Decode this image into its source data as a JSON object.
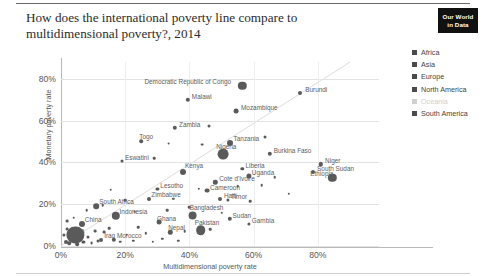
{
  "header": {
    "title": "How does the international poverty line compare to multidimensional poverty?, 2014",
    "badge_line1": "Our World",
    "badge_line2": "in Data"
  },
  "legend": {
    "position": "right",
    "items": [
      {
        "label": "Africa",
        "color": "#4a4a4a",
        "muted": false
      },
      {
        "label": "Asia",
        "color": "#4a4a4a",
        "muted": false
      },
      {
        "label": "Europe",
        "color": "#4a4a4a",
        "muted": false
      },
      {
        "label": "North America",
        "color": "#4a4a4a",
        "muted": false
      },
      {
        "label": "Oceania",
        "color": "#cfcfcf",
        "muted": true
      },
      {
        "label": "South America",
        "color": "#4a4a4a",
        "muted": false
      }
    ]
  },
  "chart_data": {
    "type": "scatter",
    "title": "How does the international poverty line compare to multidimensional poverty?, 2014",
    "xlabel": "Multidimensional poverty rate",
    "ylabel": "Monetary poverty rate",
    "xlim": [
      0,
      90
    ],
    "ylim": [
      0,
      88
    ],
    "xticks": [
      0,
      20,
      40,
      60,
      80
    ],
    "xticklabels": [
      "0%",
      "20%",
      "40%",
      "60%",
      "80%"
    ],
    "yticks": [
      0,
      20,
      40,
      60,
      80
    ],
    "yticklabels": [
      "0%",
      "20%",
      "40%",
      "60%",
      "80%"
    ],
    "grid": true,
    "reference_line": {
      "type": "diagonal-45",
      "label": "y = x"
    },
    "size_encoding": "population",
    "color_encoding": "continent",
    "points": [
      {
        "label": "Democratic Republic of Congo",
        "x": 56.5,
        "y": 76.5,
        "r": 4.2,
        "lx": -98,
        "ly": -3
      },
      {
        "label": "Burundi",
        "x": 74.5,
        "y": 73.0,
        "r": 2.0,
        "lx": 5,
        "ly": -2
      },
      {
        "label": "Malawi",
        "x": 39.5,
        "y": 70.0,
        "r": 2.2,
        "lx": 4,
        "ly": -2
      },
      {
        "label": "Mozambique",
        "x": 54.5,
        "y": 64.5,
        "r": 2.4,
        "lx": 5,
        "ly": -2
      },
      {
        "label": "Zambia",
        "x": 35.5,
        "y": 56.5,
        "r": 2.2,
        "lx": 4,
        "ly": -2
      },
      {
        "label": "Tanzania",
        "x": 52.5,
        "y": 49.5,
        "r": 3.0,
        "lx": 4,
        "ly": -3
      },
      {
        "label": "Togo",
        "x": 25.0,
        "y": 50.0,
        "r": 1.8,
        "lx": -2,
        "ly": -3
      },
      {
        "label": "Nigeria",
        "x": 50.5,
        "y": 44.0,
        "r": 5.4,
        "lx": -7,
        "ly": -6
      },
      {
        "label": "Burkina Faso",
        "x": 65.0,
        "y": 44.0,
        "r": 2.2,
        "lx": 4,
        "ly": -2
      },
      {
        "label": "Niger",
        "x": 81.0,
        "y": 39.0,
        "r": 2.2,
        "lx": 4,
        "ly": -2
      },
      {
        "label": "South Sudan",
        "x": 78.5,
        "y": 35.5,
        "r": 2.0,
        "lx": 4,
        "ly": -2
      },
      {
        "label": "Liberia",
        "x": 56.5,
        "y": 37.0,
        "r": 1.7,
        "lx": 3,
        "ly": -2
      },
      {
        "label": "Uganda",
        "x": 58.5,
        "y": 33.5,
        "r": 2.6,
        "lx": 3,
        "ly": -2
      },
      {
        "label": "Ethiopia",
        "x": 84.5,
        "y": 32.5,
        "r": 4.2,
        "lx": -22,
        "ly": -3
      },
      {
        "label": "Cote d'Ivoire",
        "x": 48.0,
        "y": 30.5,
        "r": 2.2,
        "lx": 4,
        "ly": -2
      },
      {
        "label": "Eswatini",
        "x": 19.0,
        "y": 40.5,
        "r": 1.5,
        "lx": 3,
        "ly": -2
      },
      {
        "label": "Kenya",
        "x": 38.0,
        "y": 35.5,
        "r": 3.0,
        "lx": 2,
        "ly": -5
      },
      {
        "label": "Lesotho",
        "x": 30.0,
        "y": 27.5,
        "r": 1.6,
        "lx": 3,
        "ly": -2
      },
      {
        "label": "Cameroon",
        "x": 45.5,
        "y": 26.5,
        "r": 2.4,
        "lx": 3,
        "ly": -2
      },
      {
        "label": "Zimbabwe",
        "x": 27.5,
        "y": 22.5,
        "r": 2.0,
        "lx": 2,
        "ly": -3
      },
      {
        "label": "Timor",
        "x": 52.0,
        "y": 22.0,
        "r": 1.6,
        "lx": 3,
        "ly": -2
      },
      {
        "label": "Haiti",
        "x": 49.5,
        "y": 22.5,
        "r": 2.0,
        "lx": 4,
        "ly": -2
      },
      {
        "label": "South Africa",
        "x": 11.0,
        "y": 19.0,
        "r": 2.8,
        "lx": 3,
        "ly": -3
      },
      {
        "label": "Indonesia",
        "x": 17.0,
        "y": 14.5,
        "r": 4.2,
        "lx": 4,
        "ly": -3
      },
      {
        "label": "Bangladesh",
        "x": 41.0,
        "y": 14.5,
        "r": 4.4,
        "lx": -3,
        "ly": -7
      },
      {
        "label": "Sudan",
        "x": 52.5,
        "y": 13.0,
        "r": 2.2,
        "lx": 3,
        "ly": -2
      },
      {
        "label": "Gambia",
        "x": 58.5,
        "y": 10.5,
        "r": 1.6,
        "lx": 3,
        "ly": -2
      },
      {
        "label": "Ghana",
        "x": 30.5,
        "y": 11.5,
        "r": 2.4,
        "lx": -2,
        "ly": -2
      },
      {
        "label": "Pakistan",
        "x": 43.5,
        "y": 7.5,
        "r": 4.8,
        "lx": -6,
        "ly": -6
      },
      {
        "label": "Nepal",
        "x": 34.0,
        "y": 6.5,
        "r": 2.2,
        "lx": -2,
        "ly": -3
      },
      {
        "label": "China",
        "x": 6.5,
        "y": 10.5,
        "r": 3.0,
        "lx": 3,
        "ly": -3
      },
      {
        "label": "India",
        "x": 4.5,
        "y": 5.5,
        "r": 8.6,
        "lx": -5,
        "ly": 0
      },
      {
        "label": "Iraq",
        "x": 12.5,
        "y": 3.0,
        "r": 2.0,
        "lx": 3,
        "ly": 0
      },
      {
        "label": "Morocco",
        "x": 16.5,
        "y": 3.0,
        "r": 2.2,
        "lx": 3,
        "ly": 0
      }
    ],
    "unlabeled_points": [
      {
        "x": 1.5,
        "y": 2.0,
        "r": 2.0
      },
      {
        "x": 2.5,
        "y": 1.2,
        "r": 1.8
      },
      {
        "x": 3.0,
        "y": 3.5,
        "r": 1.5
      },
      {
        "x": 1.0,
        "y": 5.5,
        "r": 1.6
      },
      {
        "x": 2.0,
        "y": 8.0,
        "r": 1.4
      },
      {
        "x": 5.0,
        "y": 1.0,
        "r": 1.8
      },
      {
        "x": 7.0,
        "y": 2.0,
        "r": 1.6
      },
      {
        "x": 8.5,
        "y": 4.5,
        "r": 1.5
      },
      {
        "x": 9.5,
        "y": 1.5,
        "r": 1.4
      },
      {
        "x": 6.0,
        "y": 6.0,
        "r": 1.5
      },
      {
        "x": 4.0,
        "y": 13.5,
        "r": 1.3
      },
      {
        "x": 1.8,
        "y": 12.0,
        "r": 1.4
      },
      {
        "x": 10.5,
        "y": 7.0,
        "r": 1.4
      },
      {
        "x": 11.5,
        "y": 2.5,
        "r": 1.5
      },
      {
        "x": 13.5,
        "y": 6.5,
        "r": 1.4
      },
      {
        "x": 15.0,
        "y": 8.5,
        "r": 1.3
      },
      {
        "x": 18.5,
        "y": 2.0,
        "r": 1.3
      },
      {
        "x": 20.5,
        "y": 5.5,
        "r": 1.3
      },
      {
        "x": 22.5,
        "y": 2.5,
        "r": 1.2
      },
      {
        "x": 24.0,
        "y": 9.0,
        "r": 1.3
      },
      {
        "x": 26.5,
        "y": 6.0,
        "r": 1.2
      },
      {
        "x": 28.5,
        "y": 2.0,
        "r": 1.2
      },
      {
        "x": 31.5,
        "y": 3.5,
        "r": 1.2
      },
      {
        "x": 36.5,
        "y": 2.5,
        "r": 1.2
      },
      {
        "x": 38.5,
        "y": 7.0,
        "r": 1.3
      },
      {
        "x": 46.5,
        "y": 8.0,
        "r": 1.3
      },
      {
        "x": 33.0,
        "y": 17.0,
        "r": 1.3
      },
      {
        "x": 40.0,
        "y": 18.5,
        "r": 1.3
      },
      {
        "x": 23.0,
        "y": 16.5,
        "r": 1.3
      },
      {
        "x": 20.0,
        "y": 22.0,
        "r": 1.3
      },
      {
        "x": 15.5,
        "y": 27.0,
        "r": 1.3
      },
      {
        "x": 43.0,
        "y": 27.5,
        "r": 1.2
      },
      {
        "x": 55.0,
        "y": 28.5,
        "r": 1.3
      },
      {
        "x": 62.5,
        "y": 29.0,
        "r": 1.3
      },
      {
        "x": 63.5,
        "y": 52.0,
        "r": 1.5
      },
      {
        "x": 46.0,
        "y": 57.5,
        "r": 1.5
      },
      {
        "x": 33.5,
        "y": 49.0,
        "r": 1.4
      },
      {
        "x": 44.0,
        "y": 48.5,
        "r": 1.4
      },
      {
        "x": 29.0,
        "y": 42.0,
        "r": 1.3
      },
      {
        "x": 59.0,
        "y": 21.5,
        "r": 1.3
      },
      {
        "x": 66.5,
        "y": 33.0,
        "r": 1.3
      },
      {
        "x": 71.0,
        "y": 25.0,
        "r": 1.2
      },
      {
        "x": 50.0,
        "y": 16.0,
        "r": 1.2
      },
      {
        "x": 35.0,
        "y": 22.5,
        "r": 1.2
      },
      {
        "x": 13.0,
        "y": 19.5,
        "r": 1.3
      },
      {
        "x": 8.0,
        "y": 17.0,
        "r": 1.3
      }
    ]
  }
}
